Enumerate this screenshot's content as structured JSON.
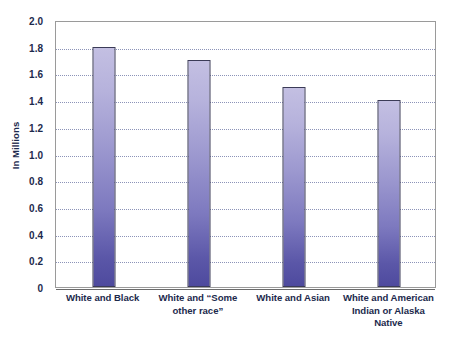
{
  "chart_data": {
    "type": "bar",
    "title": "",
    "xlabel": "",
    "ylabel": "In Millions",
    "categories": [
      "White and Black",
      "White and “Some other race”",
      "White and Asian",
      "White and American Indian or Alaska Native"
    ],
    "category_lines": [
      [
        "White and Black"
      ],
      [
        "White and “Some",
        "other race”"
      ],
      [
        "White and Asian"
      ],
      [
        "White and American",
        "Indian or Alaska",
        "Native"
      ]
    ],
    "values": [
      1.8,
      1.7,
      1.5,
      1.4
    ],
    "ylim": [
      0,
      2.0
    ],
    "ytick_step": 0.2,
    "ytick_labels": [
      "2.0",
      "1.8",
      "1.6",
      "1.4",
      "1.2",
      "1.0",
      "0.8",
      "0.6",
      "0.4",
      "0.2",
      "0"
    ],
    "ytick_values": [
      2.0,
      1.8,
      1.6,
      1.4,
      1.2,
      1.0,
      0.8,
      0.6,
      0.4,
      0.2,
      0
    ],
    "grid": true,
    "grid_orientation": "horizontal",
    "legend": false,
    "legend_position": "none",
    "colors": {
      "bar_top": "#c3bfe2",
      "bar_bottom": "#4e4a9e",
      "bar_border": "#3b3b57",
      "gridline": "#8c93b8",
      "axis_line": "#6b6b6b",
      "plot_border": "#9a9a9a",
      "text": "#1d2a4d",
      "background": "#ffffff"
    }
  }
}
